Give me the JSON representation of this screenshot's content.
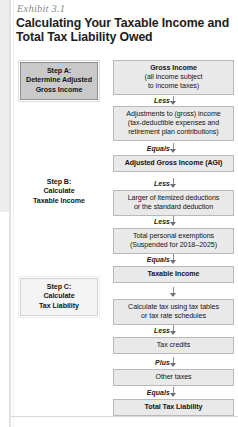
{
  "exhibit": {
    "label": "Exhibit 3.1",
    "title": "Calculating Your Taxable Income and Total Tax Liability Owed"
  },
  "steps": [
    {
      "id": "step-a",
      "label": "Step A:\nDetermine Adjusted\nGross Income",
      "line1": "Step A:",
      "line2": "Determine Adjusted",
      "line3": "Gross Income"
    },
    {
      "id": "step-b",
      "label": "Step B:\nCalculate\nTaxable Income",
      "line1": "Step B:",
      "line2": "Calculate",
      "line3": "Taxable Income"
    },
    {
      "id": "step-c",
      "label": "Step C:\nCalculate\nTax Liability",
      "line1": "Step C:",
      "line2": "Calculate",
      "line3": "Tax Liability"
    }
  ],
  "flow": {
    "boxes": [
      {
        "id": "gross-income",
        "title": "Gross Income",
        "sub1": "(all income subject",
        "sub2": "to income taxes)",
        "bold": true
      },
      {
        "id": "adjustments",
        "title": "Adjustments to (gross) income",
        "sub1": "(tax-deductible expenses and",
        "sub2": "retirement plan contributions)",
        "bold": false
      },
      {
        "id": "agi",
        "title": "Adjusted Gross Income (AGI)",
        "sub1": "",
        "sub2": "",
        "bold": true
      },
      {
        "id": "deductions",
        "title": "Larger of itemized deductions",
        "sub1": "or the standard deduction",
        "sub2": "",
        "bold": false
      },
      {
        "id": "personal-exemptions",
        "title": "Total personal exemptions",
        "sub1": "(Suspended for 2018–2025)",
        "sub2": "",
        "bold": false
      },
      {
        "id": "taxable-income",
        "title": "Taxable Income",
        "sub1": "",
        "sub2": "",
        "bold": true
      },
      {
        "id": "calculate-tax",
        "title": "Calculate tax using tax tables",
        "sub1": "or tax rate schedules",
        "sub2": "",
        "bold": false
      },
      {
        "id": "tax-credits",
        "title": "Tax credits",
        "sub1": "",
        "sub2": "",
        "bold": false
      },
      {
        "id": "other-taxes",
        "title": "Other taxes",
        "sub1": "",
        "sub2": "",
        "bold": false
      },
      {
        "id": "total-tax-liability",
        "title": "Total Tax Liability",
        "sub1": "",
        "sub2": "",
        "bold": true
      }
    ],
    "operators": [
      {
        "id": "op-1",
        "label": "Less"
      },
      {
        "id": "op-2",
        "label": "Equals"
      },
      {
        "id": "op-3",
        "label": "Less"
      },
      {
        "id": "op-4",
        "label": "Less"
      },
      {
        "id": "op-5",
        "label": "Equals"
      },
      {
        "id": "op-6",
        "label": ""
      },
      {
        "id": "op-7",
        "label": "Less"
      },
      {
        "id": "op-8",
        "label": "Plus"
      },
      {
        "id": "op-9",
        "label": "Equals"
      }
    ]
  },
  "colors": {
    "box_fill": "#e9e9e9",
    "box_border": "#b8b8b8",
    "step_a_fill": "#c9c9c9",
    "step_c_fill": "#f4f4f4",
    "arrow": "#6f6f6f",
    "text": "#141414",
    "label_gray": "#8a8a8a"
  }
}
